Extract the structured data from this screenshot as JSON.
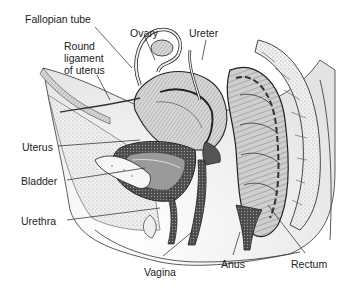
{
  "diagram": {
    "type": "anatomical-illustration",
    "labels": [
      {
        "id": "fallopian-tube",
        "text": "Fallopian tube",
        "x": 25,
        "y": 13
      },
      {
        "id": "ovary",
        "text": "Ovary",
        "x": 130,
        "y": 27
      },
      {
        "id": "ureter",
        "text": "Ureter",
        "x": 189,
        "y": 27
      },
      {
        "id": "round-ligament",
        "text": "Round\nligament\nof uterus",
        "x": 64,
        "y": 40
      },
      {
        "id": "uterus",
        "text": "Uterus",
        "x": 22,
        "y": 141
      },
      {
        "id": "bladder",
        "text": "Bladder",
        "x": 21,
        "y": 175
      },
      {
        "id": "urethra",
        "text": "Urethra",
        "x": 21,
        "y": 215
      },
      {
        "id": "vagina",
        "text": "Vagina",
        "x": 144,
        "y": 266
      },
      {
        "id": "anus",
        "text": "Anus",
        "x": 221,
        "y": 258
      },
      {
        "id": "rectum",
        "text": "Rectum",
        "x": 291,
        "y": 258
      }
    ],
    "colors": {
      "ink": "#222222",
      "tissue_light": "#e6e6e6",
      "tissue_mid": "#b8b8b8",
      "tissue_dark": "#555555",
      "background": "#ffffff"
    }
  }
}
